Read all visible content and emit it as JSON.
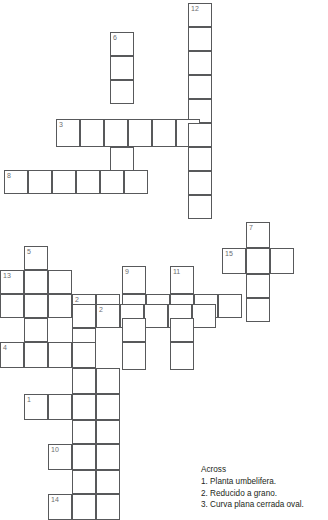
{
  "puzzle": {
    "title": "Crossword Puzzle",
    "cell_size": 24,
    "grid_color": "#58595b",
    "number_color": "#6d6e71",
    "background": "#ffffff"
  },
  "grid": {
    "cells": [
      {
        "n": "12",
        "x": 188,
        "y": 3,
        "w": 24,
        "h": 24
      },
      {
        "n": "",
        "x": 188,
        "y": 27,
        "w": 24,
        "h": 24
      },
      {
        "n": "",
        "x": 188,
        "y": 51,
        "w": 24,
        "h": 24
      },
      {
        "n": "",
        "x": 188,
        "y": 75,
        "w": 24,
        "h": 24
      },
      {
        "n": "",
        "x": 188,
        "y": 99,
        "w": 24,
        "h": 24
      },
      {
        "n": "",
        "x": 188,
        "y": 147,
        "w": 24,
        "h": 24
      },
      {
        "n": "",
        "x": 188,
        "y": 171,
        "w": 24,
        "h": 24
      },
      {
        "n": "",
        "x": 188,
        "y": 195,
        "w": 24,
        "h": 24
      },
      {
        "n": "6",
        "x": 110,
        "y": 32,
        "w": 24,
        "h": 24
      },
      {
        "n": "",
        "x": 110,
        "y": 56,
        "w": 24,
        "h": 24
      },
      {
        "n": "",
        "x": 110,
        "y": 80,
        "w": 24,
        "h": 24
      },
      {
        "n": "",
        "x": 110,
        "y": 147,
        "w": 24,
        "h": 24
      },
      {
        "n": "3",
        "x": 56,
        "y": 119,
        "w": 24,
        "h": 28
      },
      {
        "n": "",
        "x": 80,
        "y": 119,
        "w": 24,
        "h": 28
      },
      {
        "n": "",
        "x": 104,
        "y": 119,
        "w": 24,
        "h": 28
      },
      {
        "n": "",
        "x": 128,
        "y": 119,
        "w": 24,
        "h": 28
      },
      {
        "n": "",
        "x": 152,
        "y": 119,
        "w": 24,
        "h": 28
      },
      {
        "n": "",
        "x": 176,
        "y": 119,
        "w": 24,
        "h": 28
      },
      {
        "n": "",
        "x": 188,
        "y": 123,
        "w": 24,
        "h": 24
      },
      {
        "n": "8",
        "x": 4,
        "y": 170,
        "w": 24,
        "h": 24
      },
      {
        "n": "",
        "x": 28,
        "y": 170,
        "w": 24,
        "h": 24
      },
      {
        "n": "",
        "x": 52,
        "y": 170,
        "w": 24,
        "h": 24
      },
      {
        "n": "",
        "x": 76,
        "y": 170,
        "w": 24,
        "h": 24
      },
      {
        "n": "",
        "x": 100,
        "y": 170,
        "w": 24,
        "h": 24
      },
      {
        "n": "",
        "x": 124,
        "y": 170,
        "w": 24,
        "h": 24
      },
      {
        "n": "7",
        "x": 246,
        "y": 222,
        "w": 24,
        "h": 26
      },
      {
        "n": "15",
        "x": 222,
        "y": 248,
        "w": 24,
        "h": 26
      },
      {
        "n": "",
        "x": 246,
        "y": 248,
        "w": 24,
        "h": 26
      },
      {
        "n": "",
        "x": 270,
        "y": 248,
        "w": 24,
        "h": 26
      },
      {
        "n": "",
        "x": 246,
        "y": 274,
        "w": 24,
        "h": 24
      },
      {
        "n": "",
        "x": 246,
        "y": 298,
        "w": 24,
        "h": 24
      },
      {
        "n": "5",
        "x": 24,
        "y": 246,
        "w": 24,
        "h": 24
      },
      {
        "n": "",
        "x": 24,
        "y": 270,
        "w": 24,
        "h": 24
      },
      {
        "n": "13",
        "x": 0,
        "y": 270,
        "w": 24,
        "h": 24
      },
      {
        "n": "",
        "x": 48,
        "y": 270,
        "w": 24,
        "h": 24
      },
      {
        "n": "9",
        "x": 122,
        "y": 266,
        "w": 24,
        "h": 28
      },
      {
        "n": "11",
        "x": 170,
        "y": 266,
        "w": 24,
        "h": 28
      },
      {
        "n": "2",
        "x": 72,
        "y": 294,
        "w": 24,
        "h": 24
      },
      {
        "n": "",
        "x": 0,
        "y": 294,
        "w": 24,
        "h": 24
      },
      {
        "n": "",
        "x": 24,
        "y": 294,
        "w": 24,
        "h": 24
      },
      {
        "n": "",
        "x": 48,
        "y": 294,
        "w": 24,
        "h": 24
      },
      {
        "n": "",
        "x": 96,
        "y": 294,
        "w": 24,
        "h": 24
      },
      {
        "n": "",
        "x": 122,
        "y": 294,
        "w": 24,
        "h": 24
      },
      {
        "n": "",
        "x": 146,
        "y": 294,
        "w": 24,
        "h": 24
      },
      {
        "n": "",
        "x": 170,
        "y": 294,
        "w": 24,
        "h": 24
      },
      {
        "n": "",
        "x": 194,
        "y": 294,
        "w": 24,
        "h": 24
      },
      {
        "n": "",
        "x": 218,
        "y": 294,
        "w": 24,
        "h": 24
      },
      {
        "n": "2",
        "x": 96,
        "y": 304,
        "w": 24,
        "h": 24
      },
      {
        "n": "",
        "x": 72,
        "y": 304,
        "w": 24,
        "h": 24
      },
      {
        "n": "",
        "x": 120,
        "y": 304,
        "w": 24,
        "h": 24
      },
      {
        "n": "",
        "x": 144,
        "y": 304,
        "w": 24,
        "h": 24
      },
      {
        "n": "",
        "x": 168,
        "y": 304,
        "w": 24,
        "h": 24
      },
      {
        "n": "",
        "x": 192,
        "y": 304,
        "w": 24,
        "h": 24
      },
      {
        "n": "",
        "x": 24,
        "y": 318,
        "w": 24,
        "h": 24
      },
      {
        "n": "",
        "x": 72,
        "y": 328,
        "w": 24,
        "h": 24
      },
      {
        "n": "",
        "x": 122,
        "y": 318,
        "w": 24,
        "h": 24
      },
      {
        "n": "",
        "x": 170,
        "y": 318,
        "w": 24,
        "h": 24
      },
      {
        "n": "4",
        "x": 0,
        "y": 342,
        "w": 24,
        "h": 26
      },
      {
        "n": "",
        "x": 24,
        "y": 342,
        "w": 24,
        "h": 26
      },
      {
        "n": "",
        "x": 48,
        "y": 342,
        "w": 24,
        "h": 26
      },
      {
        "n": "",
        "x": 72,
        "y": 342,
        "w": 24,
        "h": 26
      },
      {
        "n": "",
        "x": 122,
        "y": 342,
        "w": 24,
        "h": 28
      },
      {
        "n": "",
        "x": 170,
        "y": 342,
        "w": 24,
        "h": 28
      },
      {
        "n": "",
        "x": 72,
        "y": 368,
        "w": 24,
        "h": 26
      },
      {
        "n": "",
        "x": 96,
        "y": 368,
        "w": 24,
        "h": 26
      },
      {
        "n": "1",
        "x": 24,
        "y": 394,
        "w": 24,
        "h": 26
      },
      {
        "n": "",
        "x": 48,
        "y": 394,
        "w": 24,
        "h": 26
      },
      {
        "n": "",
        "x": 72,
        "y": 394,
        "w": 24,
        "h": 26
      },
      {
        "n": "",
        "x": 96,
        "y": 394,
        "w": 24,
        "h": 26
      },
      {
        "n": "",
        "x": 72,
        "y": 420,
        "w": 24,
        "h": 24
      },
      {
        "n": "",
        "x": 96,
        "y": 420,
        "w": 24,
        "h": 24
      },
      {
        "n": "10",
        "x": 48,
        "y": 444,
        "w": 24,
        "h": 26
      },
      {
        "n": "",
        "x": 72,
        "y": 444,
        "w": 24,
        "h": 26
      },
      {
        "n": "",
        "x": 96,
        "y": 444,
        "w": 24,
        "h": 26
      },
      {
        "n": "",
        "x": 72,
        "y": 470,
        "w": 24,
        "h": 24
      },
      {
        "n": "",
        "x": 96,
        "y": 470,
        "w": 24,
        "h": 24
      },
      {
        "n": "14",
        "x": 48,
        "y": 494,
        "w": 24,
        "h": 26
      },
      {
        "n": "",
        "x": 72,
        "y": 494,
        "w": 24,
        "h": 26
      },
      {
        "n": "",
        "x": 96,
        "y": 494,
        "w": 24,
        "h": 26
      }
    ]
  },
  "clues": {
    "across_heading": "Across",
    "across": [
      "1. Planta umbelifera.",
      "2. Reducido a grano.",
      "3. Curva plana cerrada oval."
    ]
  }
}
